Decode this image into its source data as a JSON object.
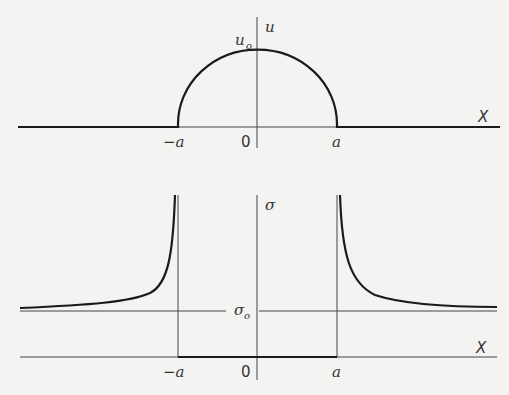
{
  "top_plot": {
    "y_axis_label": "u",
    "peak_label": "u",
    "peak_label_sub": "o",
    "x_axis_label": "X",
    "ticks": {
      "neg": "−a",
      "zero": "0",
      "pos": "a"
    }
  },
  "bottom_plot": {
    "y_axis_label": "σ",
    "level_label": "σ",
    "level_label_sub": "o",
    "x_axis_label": "X",
    "ticks": {
      "neg": "−a",
      "zero": "0",
      "pos": "a"
    }
  },
  "colors": {
    "curve": "#1a1a1a",
    "axis": "#444444",
    "background": "#f3f3f1"
  }
}
